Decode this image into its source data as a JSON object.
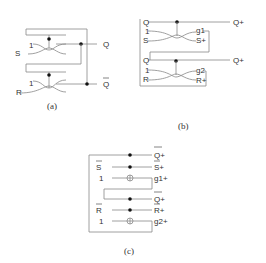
{
  "figure_a": {
    "caption": "(a)",
    "labels": {
      "s": "S",
      "r": "R",
      "one_top": "1",
      "one_bottom": "1",
      "q": "Q",
      "q_bar": "Q"
    }
  },
  "figure_b": {
    "caption": "(b)",
    "labels": {
      "q_top": "Q",
      "one_top": "1",
      "s": "S",
      "g1": "g1",
      "s_plus": "S+",
      "q_plus_top": "Q+",
      "q_bottom": "Q",
      "one_bottom": "1",
      "r": "R",
      "g2": "g2",
      "r_plus": "R+",
      "q_plus_bottom": "Q+"
    }
  },
  "figure_c": {
    "caption": "(c)",
    "labels": {
      "q_plus_bar_top": "Q+",
      "s_bar": "S",
      "s_plus_bar": "S+",
      "one_top": "1",
      "g1_plus": "g1+",
      "q_plus_bar_bottom": "Q+",
      "r_bar": "R",
      "r_plus_bar": "R+",
      "one_bottom": "1",
      "g2_plus": "g2+"
    }
  }
}
